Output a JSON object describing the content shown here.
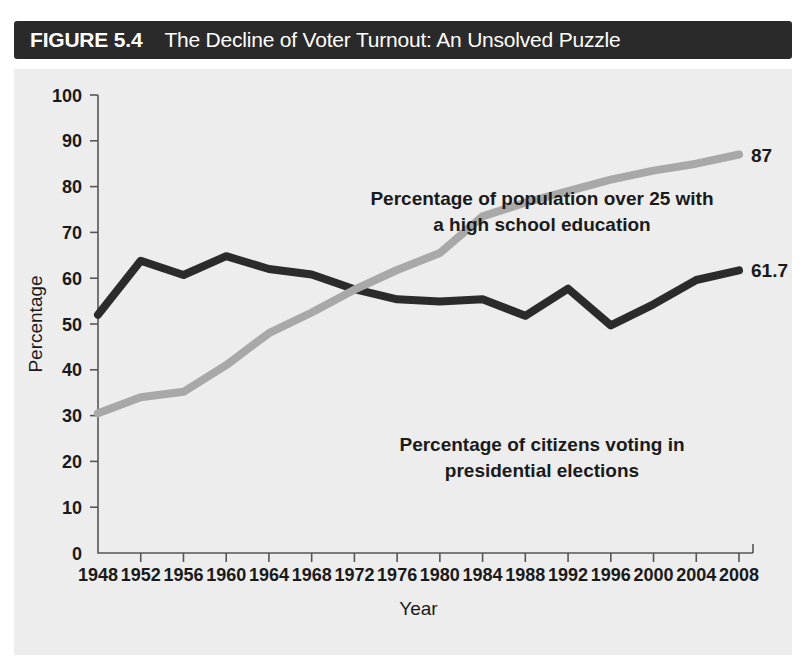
{
  "figure": {
    "number_label": "FIGURE 5.4",
    "title": "The Decline of Voter Turnout: An Unsolved Puzzle"
  },
  "colors": {
    "banner_background": "#2a2a2a",
    "banner_text": "#ffffff",
    "plot_background": "#ededed",
    "turnout_line": "#2b2b2b",
    "education_line": "#a8a8a8",
    "axis": "#555555",
    "text": "#1a1a1a"
  },
  "chart_data": {
    "type": "line",
    "title": "The Decline of Voter Turnout: An Unsolved Puzzle",
    "xlabel": "Year",
    "ylabel": "Percentage",
    "xlim": [
      1948,
      2008
    ],
    "ylim": [
      0,
      100
    ],
    "grid": false,
    "legend_position": "inline-annotations",
    "x": [
      1948,
      1952,
      1956,
      1960,
      1964,
      1968,
      1972,
      1976,
      1980,
      1984,
      1988,
      1992,
      1996,
      2000,
      2004,
      2008
    ],
    "xticklabels": [
      "1948",
      "1952",
      "1956",
      "1960",
      "1964",
      "1968",
      "1972",
      "1976",
      "1980",
      "1984",
      "1988",
      "1992",
      "1996",
      "2000",
      "2004",
      "2008"
    ],
    "yticklabels": [
      "0",
      "10",
      "20",
      "30",
      "40",
      "50",
      "60",
      "70",
      "80",
      "90",
      "100"
    ],
    "yticks": [
      0,
      10,
      20,
      30,
      40,
      50,
      60,
      70,
      80,
      90,
      100
    ],
    "series": [
      {
        "name": "Percentage of citizens voting in presidential elections",
        "color": "#2b2b2b",
        "values": [
          52.0,
          63.8,
          60.7,
          64.8,
          62.0,
          60.8,
          57.6,
          55.4,
          54.9,
          55.4,
          51.8,
          57.7,
          49.7,
          54.3,
          59.6,
          61.7
        ],
        "end_label": "61.7"
      },
      {
        "name": "Percentage of population over 25 with a high school education",
        "color": "#a8a8a8",
        "values": [
          30.5,
          34.0,
          35.2,
          41.0,
          48.0,
          52.5,
          57.5,
          61.8,
          65.5,
          73.5,
          76.5,
          79.0,
          81.5,
          83.5,
          85.0,
          87.0
        ],
        "end_label": "87"
      }
    ],
    "annotations": [
      {
        "id": "education-annotation",
        "lines": [
          "Percentage of population over 25 with",
          "a high school education"
        ],
        "x": 528,
        "y": 136
      },
      {
        "id": "turnout-annotation",
        "lines": [
          "Percentage of citizens voting in",
          "presidential elections"
        ],
        "x": 528,
        "y": 382
      }
    ]
  },
  "axis_labels": {
    "x_title": "Year",
    "y_title": "Percentage"
  },
  "end_labels": {
    "education": "87",
    "turnout": "61.7"
  },
  "annotation_text": {
    "education_line1": "Percentage of population over 25 with",
    "education_line2": "a high school education",
    "turnout_line1": "Percentage of citizens voting in",
    "turnout_line2": "presidential elections"
  }
}
